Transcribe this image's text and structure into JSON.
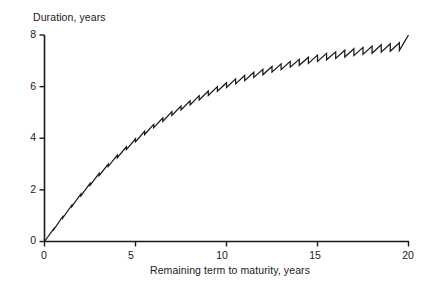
{
  "chart_data": {
    "type": "line",
    "title": "",
    "xlabel": "Remaining term to maturity, years",
    "ylabel": "Duration, years",
    "xlim": [
      0,
      20
    ],
    "ylim": [
      0,
      8
    ],
    "xticks": [
      0,
      5,
      10,
      15,
      20
    ],
    "yticks": [
      0,
      2,
      4,
      6,
      8
    ],
    "xtick_labels": [
      "0",
      "5",
      "10",
      "15",
      "20"
    ],
    "ytick_labels": [
      "0",
      "2",
      "4",
      "6",
      "8"
    ],
    "grid": false,
    "legend": "none",
    "series": [
      {
        "name": "Duration",
        "note": "Sawtooth: duration rises between coupon dates then drops at each semi-annual coupon payment; envelope is concave rising from 0 to 8.",
        "x": [
          0,
          0.5,
          1,
          1.5,
          2,
          2.5,
          3,
          3.5,
          4,
          4.5,
          5,
          5.5,
          6,
          6.5,
          7,
          7.5,
          8,
          8.5,
          9,
          9.5,
          10,
          10.5,
          11,
          11.5,
          12,
          12.5,
          13,
          13.5,
          14,
          14.5,
          15,
          15.5,
          16,
          16.5,
          17,
          17.5,
          18,
          18.5,
          19,
          19.5,
          20
        ],
        "values": [
          0.0,
          0.49,
          0.96,
          1.41,
          1.84,
          2.25,
          2.64,
          3.0,
          3.35,
          3.67,
          3.98,
          4.27,
          4.54,
          4.79,
          5.03,
          5.25,
          5.45,
          5.65,
          5.83,
          6.0,
          6.15,
          6.3,
          6.43,
          6.56,
          6.67,
          6.78,
          6.88,
          6.98,
          7.06,
          7.14,
          7.22,
          7.29,
          7.35,
          7.41,
          7.47,
          7.52,
          7.57,
          7.62,
          7.66,
          7.7,
          8.0
        ],
        "sawtooth_periods": 40,
        "sawtooth_drop_min": 0.02,
        "sawtooth_drop_max": 0.3
      }
    ],
    "readings": [
      {
        "x": 0,
        "y": 0.0
      },
      {
        "x": 5,
        "y": 3.5
      },
      {
        "x": 10,
        "y": 5.9
      },
      {
        "x": 15,
        "y": 7.0
      },
      {
        "x": 20,
        "y": 8.0
      }
    ],
    "colors": {
      "line": "#1a1a1a",
      "axis": "#1a1a1a",
      "background": "#ffffff"
    }
  }
}
